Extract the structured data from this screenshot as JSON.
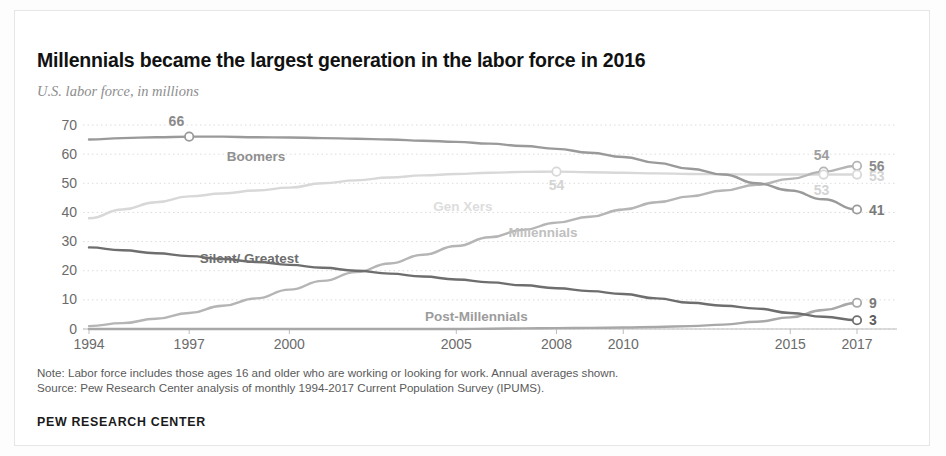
{
  "title": "Millennials became the largest generation in the labor force in 2016",
  "subtitle": "U.S. labor force, in millions",
  "notes": {
    "note": "Note: Labor force includes those ages 16 and older who are working or looking for work. Annual averages shown.",
    "source": "Source: Pew Research Center analysis of monthly 1994-2017 Current Population Survey (IPUMS)."
  },
  "footer": "PEW RESEARCH CENTER",
  "axis": {
    "y_ticks": [
      "0",
      "10",
      "20",
      "30",
      "40",
      "50",
      "60",
      "70"
    ],
    "x_ticks": [
      "1994",
      "1997",
      "2000",
      "2005",
      "2008",
      "2010",
      "2015",
      "2017"
    ]
  },
  "series_labels": {
    "boomers": "Boomers",
    "genxers": "Gen Xers",
    "millennials": "Millennials",
    "silent": "Silent/ Greatest",
    "postmillennials": "Post-Millennials"
  },
  "annotations": {
    "boomers_peak": "66",
    "genxers_peak": "54",
    "millennials_2016": "54",
    "genxers_2016": "53",
    "millennials_end": "56",
    "genxers_end": "53",
    "boomers_end": "41",
    "postmillennials_end": "9",
    "silent_end": "3"
  },
  "colors": {
    "boomers": "#9a9a9a",
    "genxers": "#d8d8d8",
    "millennials": "#b5b5b5",
    "silent": "#6e6e6e",
    "postmillennials": "#a8a8a8",
    "grid": "#dcdcdc",
    "axis_text": "#6b6b6b"
  },
  "chart_data": {
    "type": "line",
    "title": "Millennials became the largest generation in the labor force in 2016",
    "subtitle": "U.S. labor force, in millions",
    "xlabel": "",
    "ylabel": "U.S. labor force, in millions",
    "xlim": [
      1994,
      2017
    ],
    "ylim": [
      0,
      70
    ],
    "yticks": [
      0,
      10,
      20,
      30,
      40,
      50,
      60,
      70
    ],
    "xticks": [
      1994,
      1997,
      2000,
      2005,
      2008,
      2010,
      2015,
      2017
    ],
    "grid": "horizontal-dotted",
    "legend": "inline-labels",
    "x": [
      1994,
      1995,
      1996,
      1997,
      1998,
      1999,
      2000,
      2001,
      2002,
      2003,
      2004,
      2005,
      2006,
      2007,
      2008,
      2009,
      2010,
      2011,
      2012,
      2013,
      2014,
      2015,
      2016,
      2017
    ],
    "series": [
      {
        "name": "Boomers",
        "color": "#9a9a9a",
        "values": [
          65,
          65.5,
          65.8,
          66,
          66,
          65.8,
          65.7,
          65.5,
          65.3,
          65,
          64.6,
          64.2,
          63.6,
          62.8,
          61.8,
          60.5,
          59,
          57,
          55,
          53,
          50,
          47.5,
          44.5,
          41
        ]
      },
      {
        "name": "Gen Xers",
        "color": "#d8d8d8",
        "values": [
          38,
          41,
          43.5,
          45.5,
          46.5,
          47.5,
          48.5,
          50,
          51,
          52,
          52.7,
          53.2,
          53.6,
          53.9,
          54,
          53.8,
          53.6,
          53.4,
          53.2,
          53.1,
          53,
          53,
          53,
          53
        ]
      },
      {
        "name": "Millennials",
        "color": "#b5b5b5",
        "values": [
          1,
          2,
          3.5,
          5.5,
          8,
          10.5,
          13.5,
          16.5,
          19.5,
          22.5,
          25.5,
          28.5,
          31.5,
          34,
          36.5,
          38.5,
          41,
          43.5,
          45.5,
          47.5,
          49.5,
          51.5,
          54,
          56
        ]
      },
      {
        "name": "Silent/ Greatest",
        "color": "#6e6e6e",
        "values": [
          28,
          27,
          26,
          25,
          24,
          23,
          22,
          21,
          20,
          19,
          18,
          17,
          16,
          15,
          14,
          13,
          12,
          10.5,
          9,
          8,
          7,
          5.5,
          4.2,
          3
        ]
      },
      {
        "name": "Post-Millennials",
        "color": "#a8a8a8",
        "values": [
          0,
          0,
          0,
          0,
          0,
          0,
          0,
          0,
          0,
          0,
          0,
          0,
          0.1,
          0.2,
          0.3,
          0.4,
          0.5,
          0.7,
          1,
          1.5,
          2.5,
          4,
          6.5,
          9
        ]
      }
    ],
    "annotations": [
      {
        "text": "66",
        "series": "Boomers",
        "x": 1997,
        "y": 66
      },
      {
        "text": "54",
        "series": "Gen Xers",
        "x": 2008,
        "y": 54
      },
      {
        "text": "54",
        "series": "Millennials",
        "x": 2016,
        "y": 54
      },
      {
        "text": "53",
        "series": "Gen Xers",
        "x": 2016,
        "y": 53
      },
      {
        "text": "56",
        "series": "Millennials",
        "x": 2017,
        "y": 56
      },
      {
        "text": "53",
        "series": "Gen Xers",
        "x": 2017,
        "y": 53
      },
      {
        "text": "41",
        "series": "Boomers",
        "x": 2017,
        "y": 41
      },
      {
        "text": "9",
        "series": "Post-Millennials",
        "x": 2017,
        "y": 9
      },
      {
        "text": "3",
        "series": "Silent/ Greatest",
        "x": 2017,
        "y": 3
      }
    ]
  }
}
